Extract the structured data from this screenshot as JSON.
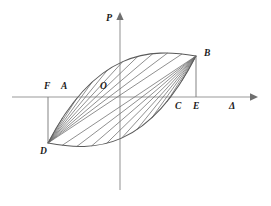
{
  "figure": {
    "type": "hysteresis-loop-diagram",
    "axes": {
      "vertical": {
        "name": "p-axis",
        "label": "P",
        "label_x": 106,
        "label_y": 13,
        "x": 120,
        "y_top": 16,
        "y_bottom": 190
      },
      "horizontal": {
        "name": "delta-axis",
        "label": "Δ",
        "label_x": 229,
        "label_y": 101,
        "y": 97,
        "x_left": 12,
        "x_right": 252
      },
      "origin": {
        "x": 120,
        "y": 97
      }
    },
    "points": [
      {
        "id": "A",
        "label": "A",
        "label_x": 61,
        "label_y": 82,
        "x": 70,
        "y": 97
      },
      {
        "id": "B",
        "label": "B",
        "label_x": 204,
        "label_y": 49,
        "x": 196,
        "y": 56
      },
      {
        "id": "C",
        "label": "C",
        "label_x": 175,
        "label_y": 102,
        "x": 172,
        "y": 97
      },
      {
        "id": "D",
        "label": "D",
        "label_x": 40,
        "label_y": 147,
        "x": 48,
        "y": 143
      },
      {
        "id": "E",
        "label": "E",
        "label_x": 193,
        "label_y": 102,
        "x": 196,
        "y": 97
      },
      {
        "id": "F",
        "label": "F",
        "label_x": 44,
        "label_y": 82,
        "x": 48,
        "y": 97
      },
      {
        "id": "O",
        "label": "O",
        "label_x": 100,
        "label_y": 82,
        "x": 120,
        "y": 97
      }
    ],
    "loop": {
      "tip_lower_left": {
        "x": 48,
        "y": 143
      },
      "tip_upper_right": {
        "x": 196,
        "y": 56
      },
      "upper_arc_control": {
        "x": 96,
        "y": 50
      },
      "upper_arc_control2": {
        "x": 150,
        "y": 48
      },
      "lower_arc_control": {
        "x": 95,
        "y": 152
      },
      "lower_arc_control2": {
        "x": 148,
        "y": 150
      }
    },
    "hatching": {
      "fan_from_lower_left_count": 9,
      "fan_from_upper_right_count": 9
    },
    "drop_lines": [
      {
        "name": "f-to-d",
        "x": 48,
        "y_top": 97,
        "y_bottom": 143
      },
      {
        "name": "e-to-b",
        "x": 196,
        "y_top": 56,
        "y_bottom": 97
      }
    ],
    "colors": {
      "axis": "#9a9a9a",
      "outline": "#5a5a5a",
      "hatch": "#6b6b6b",
      "text": "#1b1b1b",
      "background": "#ffffff"
    }
  }
}
